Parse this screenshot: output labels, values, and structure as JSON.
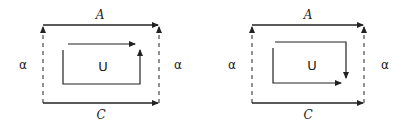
{
  "diagrams": [
    {
      "top_label": "A",
      "bottom_label": "C",
      "left_label": "α",
      "right_label": "α",
      "center_label": "U",
      "inner_orientation": "counterclockwise-top-right"
    },
    {
      "top_label": "A",
      "bottom_label": "C",
      "left_label": "α",
      "right_label": "α",
      "center_label": "U",
      "inner_orientation": "clockwise-top-right"
    }
  ],
  "colors": {
    "stroke": "#222222",
    "background": "#ffffff"
  }
}
